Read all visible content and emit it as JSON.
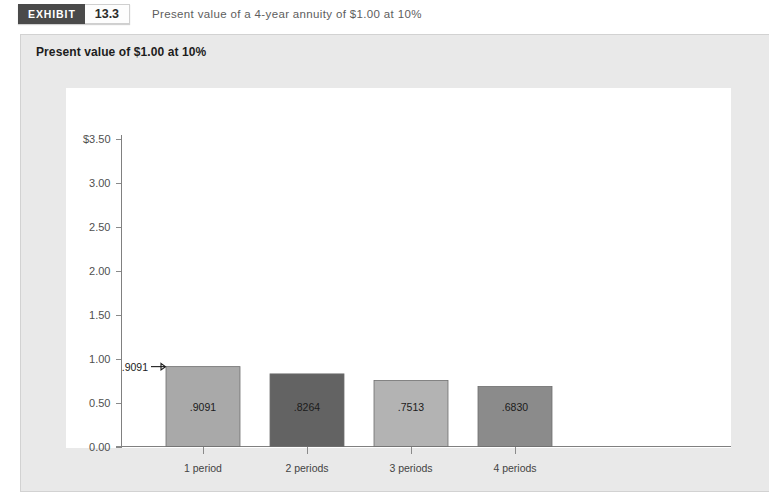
{
  "exhibit": {
    "badge_label": "EXHIBIT",
    "badge_number": "13.3",
    "caption": "Present value of a 4-year annuity of $1.00 at 10%"
  },
  "panel": {
    "title": "Present value of $1.00 at 10%"
  },
  "colors": {
    "panel_background": "#e9e9e9",
    "plot_background": "#ffffff",
    "badge_background": "#4a4a4a",
    "axis": "#808080",
    "bar_1": "#a9a9a9",
    "bar_2": "#636363",
    "bar_3": "#b3b3b3",
    "bar_4": "#8b8b8b"
  },
  "chart_data": {
    "type": "bar",
    "title": "Present value of $1.00 at 10%",
    "xlabel": "",
    "ylabel": "",
    "ylim": [
      0.0,
      3.5
    ],
    "grid": false,
    "legend": "none",
    "categories": [
      "1 period",
      "2 periods",
      "3 periods",
      "4 periods"
    ],
    "values": [
      0.9091,
      0.8264,
      0.7513,
      0.683
    ],
    "bar_labels": [
      ".9091",
      ".8264",
      ".7513",
      ".6830"
    ],
    "bar_colors": [
      "#a9a9a9",
      "#636363",
      "#b3b3b3",
      "#8b8b8b"
    ],
    "ytick_values": [
      0.0,
      0.5,
      1.0,
      1.5,
      2.0,
      2.5,
      3.0,
      3.5
    ],
    "ytick_labels": [
      "0.00",
      "0.50",
      "1.00",
      "1.50",
      "2.00",
      "2.50",
      "3.00",
      "$3.50"
    ],
    "annotations": [
      {
        "text": ".9091",
        "target_category": "1 period",
        "target_value": 0.9091,
        "arrow": "right"
      }
    ]
  }
}
